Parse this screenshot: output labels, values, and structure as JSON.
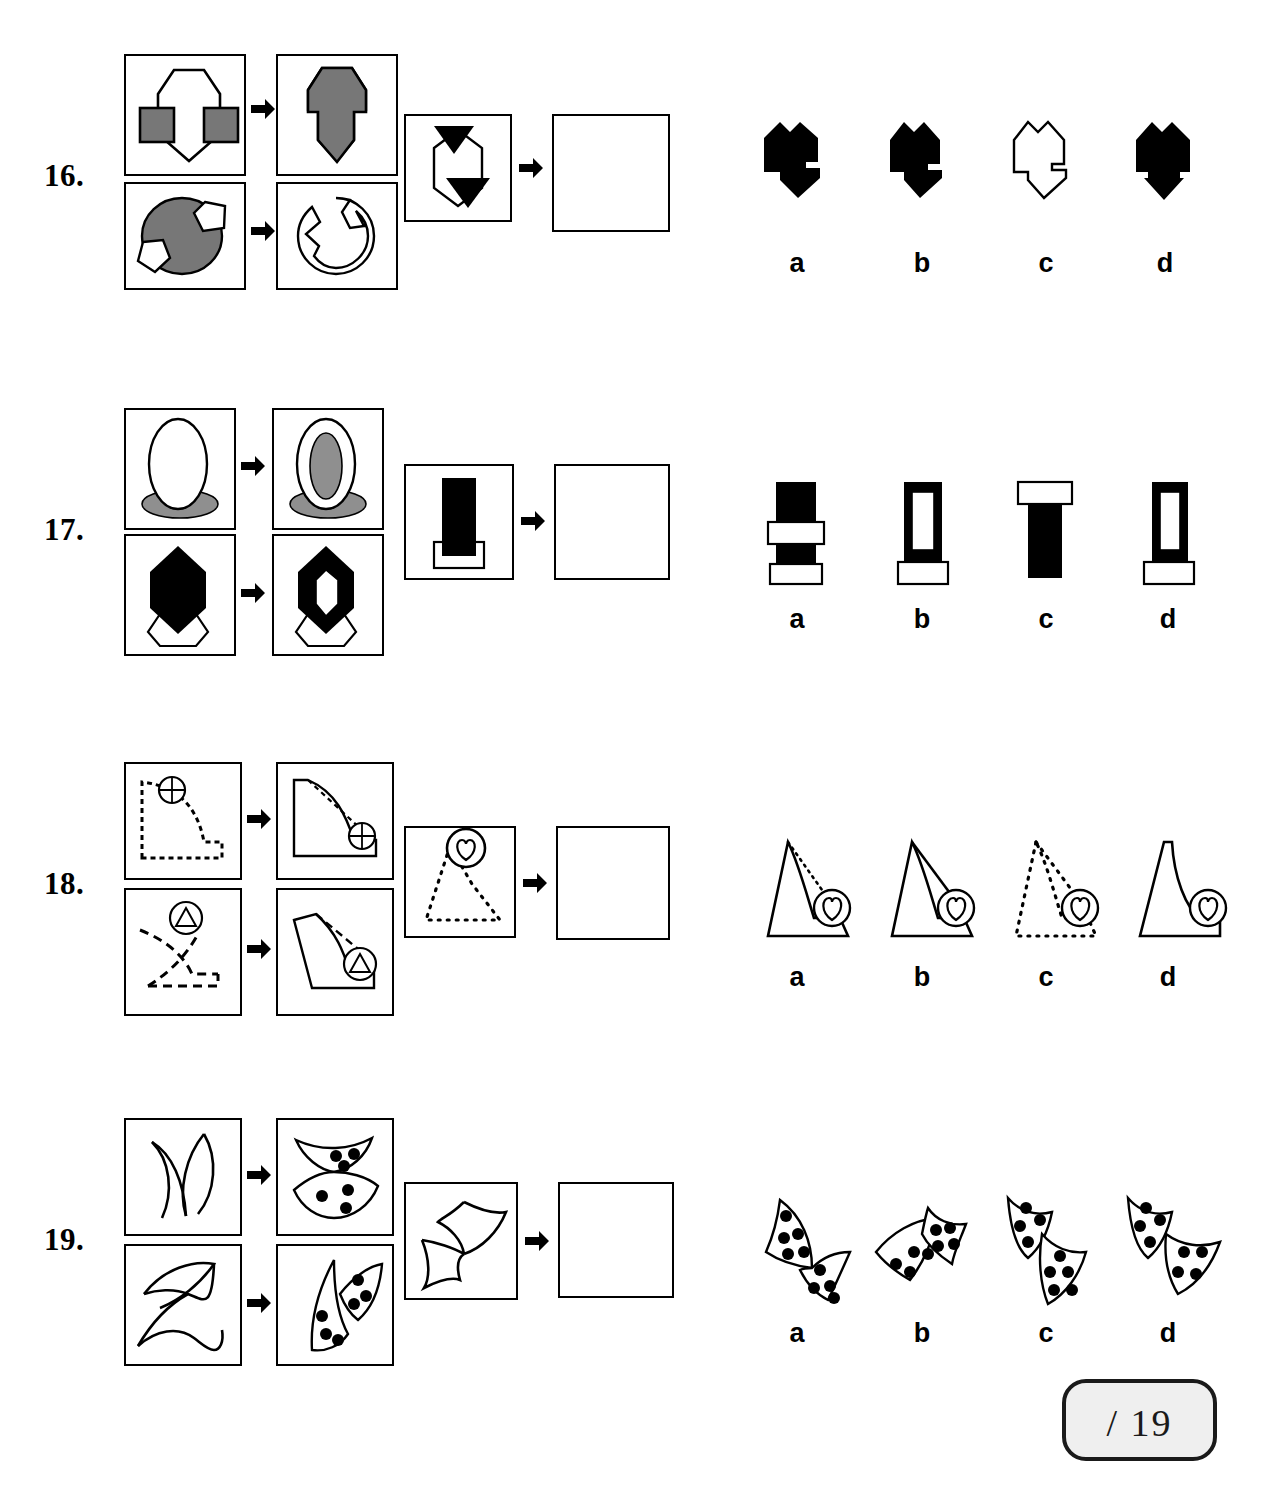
{
  "page": {
    "type": "non-verbal-reasoning-test",
    "question_numbers": [
      "16.",
      "17.",
      "18.",
      "19."
    ],
    "option_labels": [
      "a",
      "b",
      "c",
      "d"
    ],
    "score_box": {
      "text": "/ 19",
      "total": 19
    },
    "colors": {
      "ink": "#000000",
      "gray_fill": "#777777",
      "black_fill": "#000000",
      "white_fill": "#ffffff",
      "score_bg": "#efefef",
      "page_bg": "#ffffff"
    }
  },
  "questions": [
    {
      "number": "16.",
      "example_top": {
        "left": "outlined-flask-shape-with-two-gray-squares",
        "right": "gray-filled-merged-arrow-shape"
      },
      "example_bottom": {
        "left": "gray-circle-with-two-white-pentagons",
        "right": "outlined-circle-with-pentagon-notches"
      },
      "prompt": {
        "left": "outlined-hexagon-with-two-black-triangles",
        "right": "empty-answer-box"
      },
      "options": [
        {
          "label": "a",
          "desc": "black-notched-hexagon-wide"
        },
        {
          "label": "b",
          "desc": "black-notched-hexagon-narrow"
        },
        {
          "label": "c",
          "desc": "white-outlined-notched-hexagon"
        },
        {
          "label": "d",
          "desc": "black-notched-hexagon-with-point"
        }
      ]
    },
    {
      "number": "17.",
      "example_top": {
        "left": "white-ellipse-over-gray-ellipse",
        "right": "white-ellipse-with-gray-inner-ellipse-over-gray-ellipse"
      },
      "example_bottom": {
        "left": "black-hexagon-over-white-hexagon",
        "right": "black-hexagon-with-white-inner-hexagon-over-white-hexagon"
      },
      "prompt": {
        "left": "black-rectangle-over-white-rectangle",
        "right": "empty-answer-box"
      },
      "options": [
        {
          "label": "a",
          "desc": "black-bar-with-white-band-and-base"
        },
        {
          "label": "b",
          "desc": "black-bar-hollow-with-white-base"
        },
        {
          "label": "c",
          "desc": "white-cap-over-black-bar"
        },
        {
          "label": "d",
          "desc": "black-bar-hollow-with-offset-base"
        }
      ]
    },
    {
      "number": "18.",
      "example_top": {
        "left": "dashed-L-curve-with-crossed-circle-top",
        "right": "solid-curve-shape-with-crossed-circle-at-curve"
      },
      "example_bottom": {
        "left": "dashed-slanted-curve-with-triangle-circle",
        "right": "solid-slanted-shape-with-triangle-circle-at-curve"
      },
      "prompt": {
        "left": "dotted-triangle-curve-with-heart-circle",
        "right": "empty-answer-box"
      },
      "options": [
        {
          "label": "a",
          "desc": "solid-peak-with-dotted-hypotenuse-heart-circle"
        },
        {
          "label": "b",
          "desc": "solid-peak-with-solid-hypotenuse-heart-circle"
        },
        {
          "label": "c",
          "desc": "all-dotted-peak-with-heart-circle"
        },
        {
          "label": "d",
          "desc": "solid-concave-peak-with-heart-circle"
        }
      ]
    },
    {
      "number": "19.",
      "example_top": {
        "left": "two-open-crossing-curves",
        "right": "two-closed-dotted-lobes-3-and-4-dots"
      },
      "example_bottom": {
        "left": "two-open-crossing-curves-slanted",
        "right": "two-closed-dotted-lobes-slanted"
      },
      "prompt": {
        "left": "two-open-crossing-curves-hooked",
        "right": "empty-answer-box"
      },
      "options": [
        {
          "label": "a",
          "desc": "two-lobes-upper-left-lower-right-dots"
        },
        {
          "label": "b",
          "desc": "two-lobes-lower-left-upper-right-dots"
        },
        {
          "label": "c",
          "desc": "two-lobes-hooked-vertical-dots"
        },
        {
          "label": "d",
          "desc": "two-lobes-hooked-horizontal-dots"
        }
      ]
    }
  ]
}
